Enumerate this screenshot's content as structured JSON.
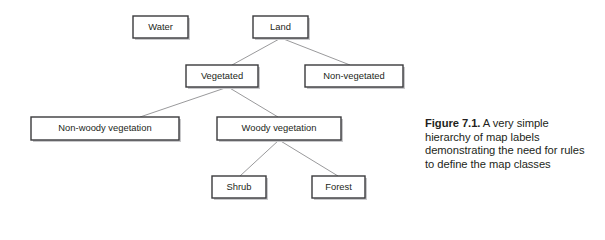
{
  "figure": {
    "caption_label": "Figure 7.1.",
    "caption_text": " A very simple hierarchy of map labels demonstrating the need for rules to define the map classes"
  },
  "diagram": {
    "type": "hierarchy-tree",
    "nodes": [
      {
        "id": "water",
        "label": "Water",
        "x": 133,
        "y": 16,
        "w": 55,
        "h": 22,
        "level": 0
      },
      {
        "id": "land",
        "label": "Land",
        "x": 253,
        "y": 16,
        "w": 55,
        "h": 22,
        "level": 0
      },
      {
        "id": "vegetated",
        "label": "Vegetated",
        "x": 186,
        "y": 65,
        "w": 72,
        "h": 22,
        "level": 1
      },
      {
        "id": "nonveg",
        "label": "Non-vegetated",
        "x": 305,
        "y": 65,
        "w": 98,
        "h": 22,
        "level": 1
      },
      {
        "id": "nonwoody",
        "label": "Non-woody vegetation",
        "x": 31,
        "y": 117,
        "w": 148,
        "h": 23,
        "level": 2
      },
      {
        "id": "woody",
        "label": "Woody vegetation",
        "x": 217,
        "y": 117,
        "w": 124,
        "h": 23,
        "level": 2
      },
      {
        "id": "shrub",
        "label": "Shrub",
        "x": 212,
        "y": 176,
        "w": 54,
        "h": 22,
        "level": 3
      },
      {
        "id": "forest",
        "label": "Forest",
        "x": 312,
        "y": 176,
        "w": 53,
        "h": 22,
        "level": 3
      }
    ],
    "edges": [
      {
        "from": "land",
        "to": "vegetated",
        "x1": 281,
        "y1": 38,
        "x2": 232,
        "y2": 65
      },
      {
        "from": "land",
        "to": "nonveg",
        "x1": 281,
        "y1": 38,
        "x2": 350,
        "y2": 65
      },
      {
        "from": "vegetated",
        "to": "nonwoody",
        "x1": 228,
        "y1": 87,
        "x2": 140,
        "y2": 117
      },
      {
        "from": "vegetated",
        "to": "woody",
        "x1": 228,
        "y1": 87,
        "x2": 278,
        "y2": 117
      },
      {
        "from": "woody",
        "to": "shrub",
        "x1": 279,
        "y1": 140,
        "x2": 240,
        "y2": 176
      },
      {
        "from": "woody",
        "to": "forest",
        "x1": 279,
        "y1": 140,
        "x2": 338,
        "y2": 176
      }
    ],
    "colors": {
      "box_fill": "#ffffff",
      "box_border": "#3a3a3c",
      "box_shadow": "#c9c9cb",
      "connector": "#9a9a9c",
      "text": "#231f20",
      "background": "#ffffff"
    }
  }
}
